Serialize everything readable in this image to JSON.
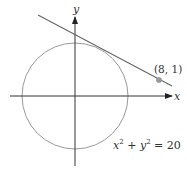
{
  "diagram": {
    "axes": {
      "x_label": "x",
      "y_label": "y"
    },
    "circle": {
      "equation_lhs": "x",
      "equation_sup1": "2",
      "equation_mid": " + y",
      "equation_sup2": "2",
      "equation_rhs": " = 20",
      "color": "#999999"
    },
    "point": {
      "label": "(8, 1)",
      "color": "#999999"
    },
    "tangent_line": {
      "color": "#666666"
    },
    "axis_color": "#333333"
  }
}
